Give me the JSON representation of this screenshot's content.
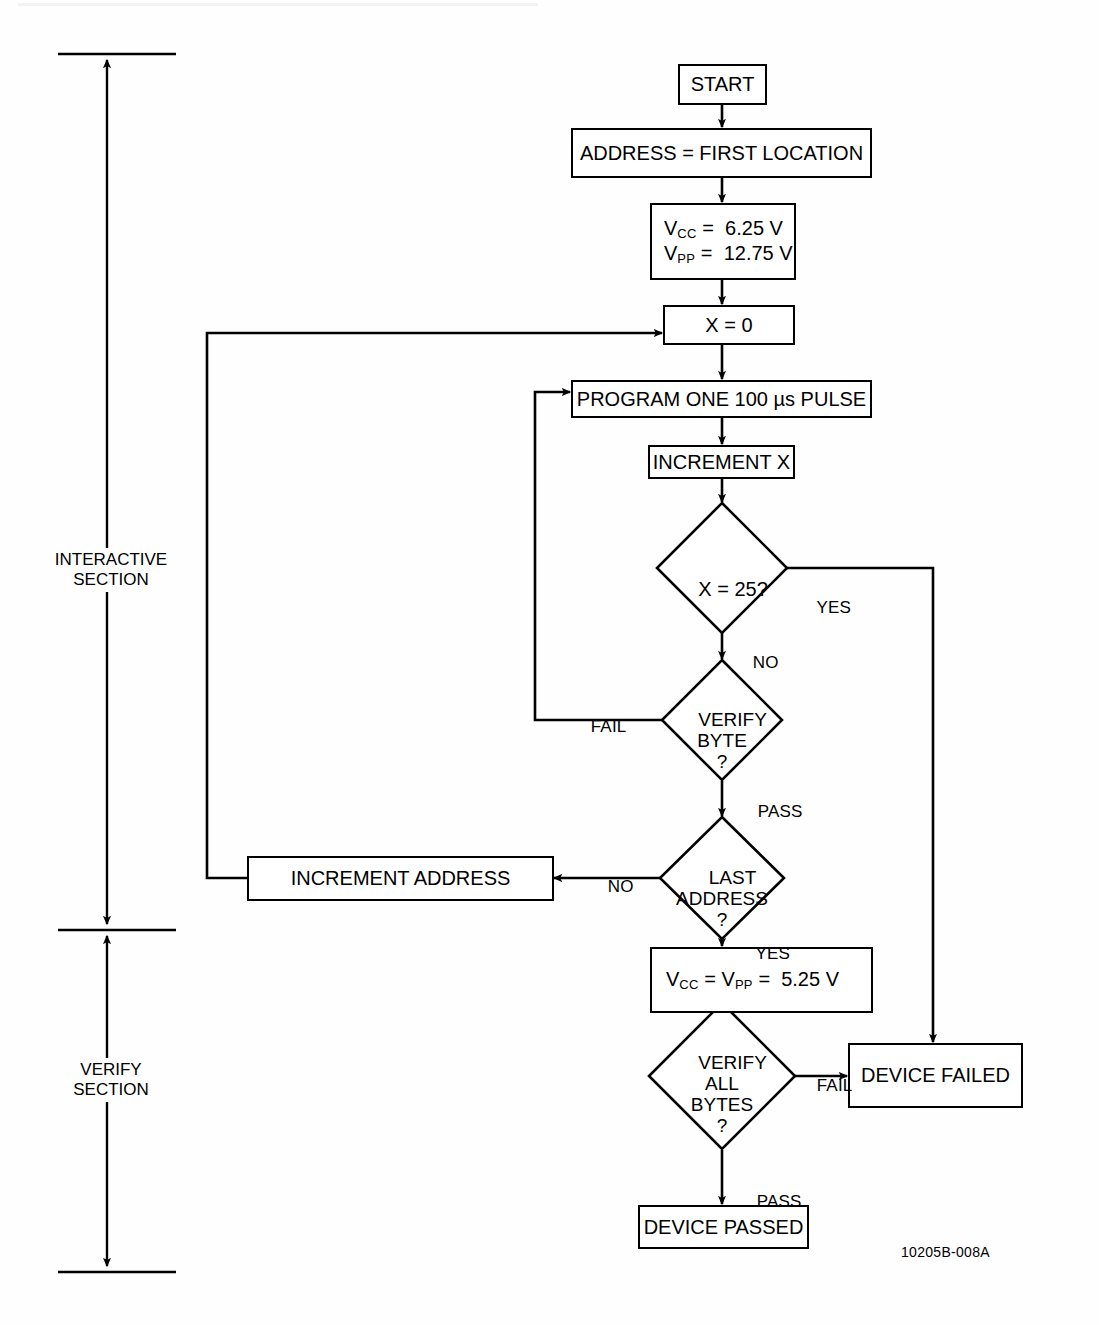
{
  "figure": {
    "id_code": "10205B-008A",
    "type": "flowchart"
  },
  "sections": [
    {
      "name": "interactive",
      "label": "INTERACTIVE\nSECTION"
    },
    {
      "name": "verify",
      "label": "VERIFY\nSECTION"
    }
  ],
  "nodes": {
    "start": {
      "shape": "box",
      "label": "START"
    },
    "address_first": {
      "shape": "box",
      "label": "ADDRESS = FIRST LOCATION"
    },
    "set_voltages": {
      "shape": "box",
      "line1_sym": "V",
      "line1_sub": "CC",
      "line1_rest": " =  6.25 V",
      "line2_sym": "V",
      "line2_sub": "PP",
      "line2_rest": " =  12.75 V"
    },
    "x_zero": {
      "shape": "box",
      "label": "X = 0"
    },
    "program_pulse": {
      "shape": "box",
      "label": "PROGRAM ONE  100 µs PULSE"
    },
    "increment_x": {
      "shape": "box",
      "label": "INCREMENT X"
    },
    "x_equals_25": {
      "shape": "diamond",
      "label": "X = 25?"
    },
    "verify_byte": {
      "shape": "diamond",
      "label": "VERIFY\nBYTE\n?"
    },
    "last_address": {
      "shape": "diamond",
      "label": "LAST\nADDRESS\n?"
    },
    "increment_address": {
      "shape": "box",
      "label": "INCREMENT ADDRESS"
    },
    "set_voltages_verify": {
      "shape": "box",
      "sym1": "V",
      "sub1": "CC",
      "mid": " = ",
      "sym2": "V",
      "sub2": "PP",
      "rest": " =  5.25 V"
    },
    "verify_all_bytes": {
      "shape": "diamond",
      "label": "VERIFY\nALL\nBYTES\n?"
    },
    "device_failed": {
      "shape": "box",
      "label": "DEVICE FAILED"
    },
    "device_passed": {
      "shape": "box",
      "label": "DEVICE PASSED"
    }
  },
  "edge_labels": {
    "x25_yes": "YES",
    "x25_no": "NO",
    "verify_byte_fail": "FAIL",
    "verify_byte_pass": "PASS",
    "last_address_no": "NO",
    "last_address_yes": "YES",
    "verify_all_fail": "FAIL",
    "verify_all_pass": "PASS"
  },
  "colors": {
    "ink": "#000000",
    "paper": "#ffffff"
  }
}
